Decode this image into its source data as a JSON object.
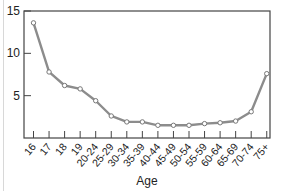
{
  "chart_data": {
    "type": "line",
    "title": "",
    "xlabel": "Age",
    "ylabel": "",
    "ylim": [
      0,
      15
    ],
    "yticks": [
      5,
      10,
      15
    ],
    "grid": false,
    "legend": null,
    "categories": [
      "16",
      "17",
      "18",
      "19",
      "20-24",
      "25-29",
      "30-34",
      "35-39",
      "40-44",
      "45-49",
      "50-54",
      "55-59",
      "60-64",
      "65-69",
      "70-74",
      "75+"
    ],
    "series": [
      {
        "name": "",
        "values": [
          13.6,
          7.8,
          6.2,
          5.8,
          4.4,
          2.6,
          1.9,
          1.9,
          1.5,
          1.5,
          1.5,
          1.7,
          1.8,
          2.0,
          3.1,
          7.6
        ]
      }
    ]
  },
  "style": {
    "line_color": "#8c8c8c",
    "marker_fill": "#ffffff",
    "marker_stroke": "#777777",
    "frame_color": "#444444"
  }
}
